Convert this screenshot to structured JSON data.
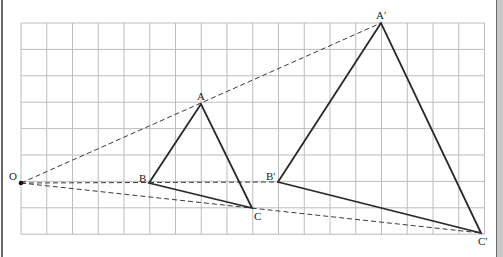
{
  "diagram": {
    "type": "homothety-enlargement",
    "grid": {
      "x0": 21,
      "y0": 23,
      "cols": 18,
      "rows": 8,
      "cell_w": 25.75,
      "cell_h": 26.4,
      "color": "#bdbdbd"
    },
    "center": {
      "label": "O",
      "x": 21,
      "y": 183
    },
    "original_triangle": {
      "A": {
        "label": "A",
        "x": 201,
        "y": 104
      },
      "B": {
        "label": "B",
        "x": 149,
        "y": 183
      },
      "C": {
        "label": "C",
        "x": 252,
        "y": 208
      }
    },
    "image_triangle": {
      "A": {
        "label": "A′",
        "x": 381,
        "y": 23
      },
      "B": {
        "label": "B′",
        "x": 278,
        "y": 182
      },
      "C": {
        "label": "C′",
        "x": 481,
        "y": 233
      }
    },
    "colors": {
      "line": "#2a2a2a",
      "dashed": "#3a3a3a",
      "grid": "#bdbdbd"
    }
  }
}
